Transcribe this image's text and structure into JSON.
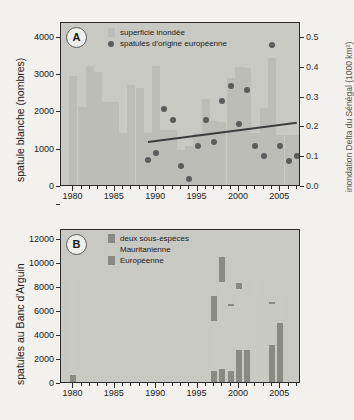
{
  "figure": {
    "background_color": "#f2f1ee",
    "plot_background_color": "#c9c9c4",
    "bar_color": "#bdbdb8",
    "bar_color_light": "#d6d6d1",
    "dot_color": "#5c5c5c",
    "dark_color": "#7a7a75",
    "trend_color": "#3d3d3d"
  },
  "chart_data": [
    {
      "type": "bar",
      "panel": "A",
      "title": "",
      "xlabel": "",
      "ylabel": "spatule blanche (nombres)",
      "ylabel_right": "inondation Delta du Sénégal (1000 km²)",
      "xlim": [
        1979,
        2008
      ],
      "ylim": [
        0,
        4400
      ],
      "ylim_right": [
        0,
        0.55
      ],
      "yticks": [
        0,
        1000,
        2000,
        3000,
        4000
      ],
      "ytick_labels": [
        "0",
        "1000",
        "2000",
        "3000",
        "4000"
      ],
      "yticks_right": [
        0.0,
        0.1,
        0.2,
        0.3,
        0.4,
        0.5
      ],
      "ytick_labels_right": [
        "0.0",
        "0.1",
        "0.2",
        "0.3",
        "0.4",
        "0.5"
      ],
      "xticks": [
        1980,
        1985,
        1990,
        1995,
        2000,
        2005
      ],
      "xtick_labels": [
        "1980",
        "1985",
        "1990",
        "1995",
        "2000",
        "2005"
      ],
      "grid": false,
      "legend_position": "top-center",
      "legend": [
        "superficie inondée",
        "spatules d'origine européenne"
      ],
      "series": [
        {
          "name": "superficie inondée",
          "render": "bar",
          "axis": "right",
          "categories": [
            1980,
            1981,
            1982,
            1983,
            1984,
            1985,
            1986,
            1987,
            1988,
            1989,
            1990,
            1991,
            1992,
            1993,
            1994,
            1995,
            1996,
            1997,
            1998,
            1999,
            2000,
            2001,
            2002,
            2003,
            2004,
            2005,
            2006,
            2007
          ],
          "values": [
            0.365,
            0.262,
            0.4,
            0.38,
            0.278,
            0.278,
            0.175,
            0.335,
            0.325,
            0.175,
            0.4,
            0.183,
            0.183,
            0.118,
            0.13,
            0.175,
            0.29,
            0.215,
            0.213,
            0.358,
            0.395,
            0.393,
            0.175,
            0.258,
            0.425,
            0.168,
            0.168,
            0.168
          ]
        },
        {
          "name": "spatules d'origine européenne",
          "render": "scatter",
          "axis": "left",
          "x": [
            1989,
            1990,
            1991,
            1992,
            1993,
            1994,
            1995,
            1996,
            1997,
            1998,
            1999,
            2000,
            2001,
            2002,
            2003,
            2004,
            2005,
            2006,
            2007
          ],
          "values": [
            720,
            900,
            2100,
            1800,
            570,
            210,
            1090,
            1800,
            1200,
            2300,
            2700,
            1700,
            2610,
            1090,
            820,
            3800,
            1090,
            710,
            820
          ]
        },
        {
          "name": "trend",
          "render": "line",
          "axis": "left",
          "x": [
            1989,
            2007
          ],
          "values": [
            1240,
            1760
          ]
        }
      ]
    },
    {
      "type": "bar",
      "panel": "B",
      "title": "",
      "xlabel": "",
      "ylabel": "spatules au Banc d'Arguin",
      "xlim": [
        1979,
        2008
      ],
      "ylim": [
        0,
        12800
      ],
      "yticks": [
        0,
        2000,
        4000,
        6000,
        8000,
        10000,
        12000
      ],
      "ytick_labels": [
        "0",
        "2000",
        "4000",
        "6000",
        "8000",
        "10000",
        "12000"
      ],
      "xticks": [
        1980,
        1985,
        1990,
        1995,
        2000,
        2005
      ],
      "xtick_labels": [
        "1980",
        "1985",
        "1990",
        "1995",
        "2000",
        "2005"
      ],
      "grid": false,
      "stacked": true,
      "legend_position": "top-center",
      "legend": [
        "deux sous-espèces",
        "Mauritanienne",
        "Européenne"
      ],
      "categories": [
        1980,
        1997,
        1998,
        1999,
        2000,
        2001,
        2002,
        2003,
        2004,
        2005
      ],
      "series": [
        {
          "name": "Européenne",
          "color": "#8a8a85",
          "values": [
            620,
            880,
            1050,
            930,
            2680,
            2690,
            0,
            0,
            3060,
            4900
          ]
        },
        {
          "name": "Mauritanienne",
          "color": "#cacac5",
          "values": [
            8080,
            4150,
            7250,
            5400,
            5050,
            4580,
            8500,
            6830,
            3430,
            2250
          ]
        },
        {
          "name": "deux sous-espèces",
          "color": "#8a8a85",
          "values": [
            0,
            2120,
            2100,
            150,
            460,
            0,
            0,
            0,
            170,
            0
          ]
        }
      ]
    }
  ],
  "panel_a": {
    "letter": "A",
    "ylabel": "spatule blanche (nombres)",
    "ylabel_right": "inondation Delta du Sénégal (1000 km²)",
    "legend": [
      {
        "label": "superficie inondée",
        "marker": "swatch"
      },
      {
        "label": "spatules d'origine européenne",
        "marker": "dot"
      }
    ]
  },
  "panel_b": {
    "letter": "B",
    "ylabel": "spatules au Banc d'Arguin",
    "legend": [
      {
        "label": "deux sous-espèces",
        "marker": "swatch-dark"
      },
      {
        "label": "Mauritanienne",
        "marker": "swatch-light"
      },
      {
        "label": "Européenne",
        "marker": "swatch-dark"
      }
    ]
  }
}
